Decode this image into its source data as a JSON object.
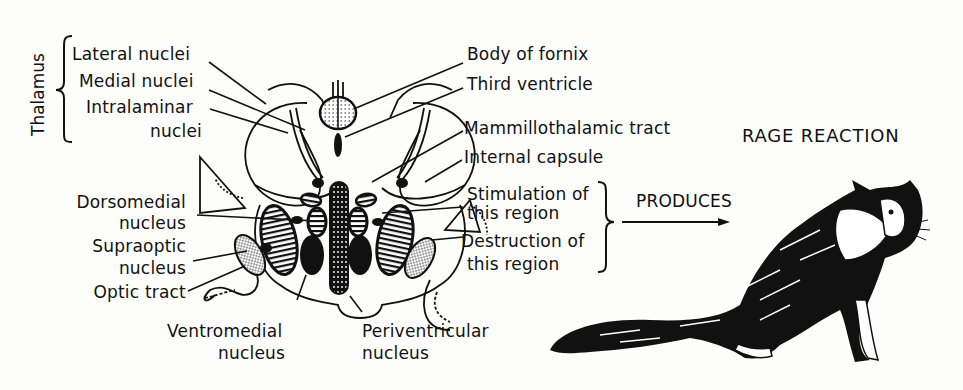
{
  "figure": {
    "title": "RAGE REACTION",
    "arrow_label": "PRODUCES"
  },
  "thalamus": {
    "group_label": "Thalamus",
    "items": [
      {
        "label": "Lateral nuclei"
      },
      {
        "label": "Medial nuclei"
      },
      {
        "label_line1": "Intralaminar",
        "label_line2": "nuclei"
      }
    ]
  },
  "right_labels": {
    "body_of_fornix": "Body of fornix",
    "third_ventricle": "Third ventricle",
    "mammillothalamic_tract": "Mammillothalamic tract",
    "internal_capsule": "Internal capsule",
    "stimulation": {
      "line1": "Stimulation of",
      "line2": "this region"
    },
    "destruction": {
      "line1": "Destruction of",
      "line2": "this region"
    }
  },
  "left_labels": {
    "dorsomedial": {
      "line1": "Dorsomedial",
      "line2": "nucleus"
    },
    "supraoptic": {
      "line1": "Supraoptic",
      "line2": "nucleus"
    },
    "optic_tract": "Optic tract"
  },
  "bottom_labels": {
    "ventromedial": {
      "line1": "Ventromedial",
      "line2": "nucleus"
    },
    "periventricular": {
      "line1": "Periventricular",
      "line2": "nucleus"
    }
  },
  "illustration": {
    "subject": "cat-in-rage-posture"
  }
}
